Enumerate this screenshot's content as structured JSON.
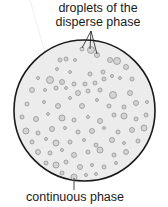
{
  "labels": {
    "top_line1": "droplets of the",
    "top_line2": "disperse phase",
    "bottom": "continuous phase"
  },
  "colors": {
    "circle_fill": "#ececec",
    "circle_stroke": "#1a1a1a",
    "droplet_fill": "#d4d4d4",
    "droplet_stroke": "#8a8a8a",
    "leader": "#1a1a1a"
  },
  "circle": {
    "cx": 84.5,
    "cy": 110.5,
    "r": 70.5
  },
  "leaders": {
    "top_origin": [
      91,
      31
    ],
    "top_targets": [
      [
        82,
        48
      ],
      [
        90,
        49
      ],
      [
        97,
        54
      ]
    ],
    "bottom": [
      [
        74,
        178
      ],
      [
        74,
        190
      ]
    ]
  },
  "droplets": [
    [
      82,
      49,
      2
    ],
    [
      91,
      50,
      3.5
    ],
    [
      97,
      55,
      2.5
    ],
    [
      60,
      60,
      2
    ],
    [
      66,
      59,
      2
    ],
    [
      75,
      60,
      1.5
    ],
    [
      110,
      60,
      2.5
    ],
    [
      117,
      61,
      3.5
    ],
    [
      57,
      69,
      1.5
    ],
    [
      70,
      72,
      1.5
    ],
    [
      90,
      74,
      2
    ],
    [
      103,
      72,
      2
    ],
    [
      112,
      76,
      1.5
    ],
    [
      126,
      67,
      2.5
    ],
    [
      38,
      78,
      1.5
    ],
    [
      50,
      80,
      3.5
    ],
    [
      62,
      82,
      2.5
    ],
    [
      74,
      84,
      2
    ],
    [
      85,
      84,
      2
    ],
    [
      95,
      83,
      2
    ],
    [
      104,
      79,
      2
    ],
    [
      120,
      78,
      1.5
    ],
    [
      132,
      79,
      2
    ],
    [
      32,
      90,
      2.5
    ],
    [
      45,
      90,
      1.5
    ],
    [
      56,
      88,
      2
    ],
    [
      66,
      88,
      1.5
    ],
    [
      78,
      93,
      2.5
    ],
    [
      88,
      91,
      2
    ],
    [
      100,
      90,
      2
    ],
    [
      113,
      95,
      3.5
    ],
    [
      130,
      93,
      2.5
    ],
    [
      27,
      104,
      2
    ],
    [
      44,
      102,
      1.5
    ],
    [
      58,
      106,
      2.5
    ],
    [
      70,
      98,
      1.5
    ],
    [
      82,
      106,
      2.5
    ],
    [
      97,
      100,
      1.5
    ],
    [
      109,
      106,
      2
    ],
    [
      124,
      107,
      2
    ],
    [
      136,
      103,
      2.5
    ],
    [
      147,
      102,
      1.5
    ],
    [
      22,
      117,
      2
    ],
    [
      36,
      119,
      2.5
    ],
    [
      48,
      114,
      1.5
    ],
    [
      62,
      118,
      3
    ],
    [
      74,
      120,
      2
    ],
    [
      88,
      117,
      1.5
    ],
    [
      100,
      121,
      2.5
    ],
    [
      114,
      115,
      2
    ],
    [
      124,
      116,
      3
    ],
    [
      136,
      119,
      2
    ],
    [
      146,
      115,
      2
    ],
    [
      26,
      131,
      3
    ],
    [
      38,
      133,
      2
    ],
    [
      52,
      129,
      2.5
    ],
    [
      65,
      128,
      1.5
    ],
    [
      78,
      132,
      2
    ],
    [
      92,
      131,
      2.5
    ],
    [
      104,
      128,
      1.5
    ],
    [
      118,
      132,
      2
    ],
    [
      132,
      130,
      2.5
    ],
    [
      144,
      128,
      3
    ],
    [
      32,
      142,
      2
    ],
    [
      46,
      139,
      1.5
    ],
    [
      56,
      143,
      3
    ],
    [
      70,
      142,
      2
    ],
    [
      84,
      140,
      1.5
    ],
    [
      96,
      145,
      2
    ],
    [
      112,
      140,
      2.5
    ],
    [
      124,
      143,
      1.5
    ],
    [
      138,
      141,
      2
    ],
    [
      38,
      152,
      2.5
    ],
    [
      50,
      153,
      2
    ],
    [
      62,
      150,
      1.5
    ],
    [
      74,
      155,
      2.5
    ],
    [
      88,
      152,
      2
    ],
    [
      100,
      150,
      3
    ],
    [
      114,
      155,
      2
    ],
    [
      126,
      152,
      2.5
    ],
    [
      46,
      163,
      2
    ],
    [
      56,
      165,
      3
    ],
    [
      66,
      162,
      2
    ],
    [
      80,
      167,
      2.5
    ],
    [
      92,
      165,
      1.5
    ],
    [
      104,
      167,
      2
    ],
    [
      116,
      163,
      1.5
    ],
    [
      62,
      173,
      2
    ],
    [
      74,
      177,
      3
    ],
    [
      86,
      175,
      1.5
    ],
    [
      96,
      174,
      1.5
    ]
  ]
}
